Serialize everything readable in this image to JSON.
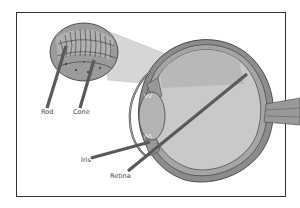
{
  "diagram": {
    "labels": [
      {
        "id": "rod",
        "text": "Rod",
        "x": 41,
        "y": 109
      },
      {
        "id": "cone",
        "text": "Cone",
        "x": 73,
        "y": 109
      },
      {
        "id": "iris",
        "text": "Iris",
        "x": 81,
        "y": 157
      },
      {
        "id": "retina",
        "text": "Retina",
        "x": 110,
        "y": 173
      }
    ],
    "colors": {
      "background": "#ffffff",
      "frame": "#333333",
      "eye_fill": "#c8c8c8",
      "eye_wall": "#8a8a8a",
      "outline": "#3a3a3a",
      "pointer": "#5a5a5a",
      "beam": "#d8d8d8",
      "lens": "#b5b5b5",
      "inset_fill": "#9a9a9a"
    }
  }
}
